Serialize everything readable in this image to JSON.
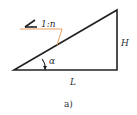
{
  "diagram": {
    "slope_label": "1:n",
    "height_label": "H",
    "length_label": "L",
    "angle_label": "α",
    "caption": "a)",
    "colors": {
      "line": "#222222",
      "slope_marker": "#e8a060",
      "text": "#333333"
    }
  }
}
